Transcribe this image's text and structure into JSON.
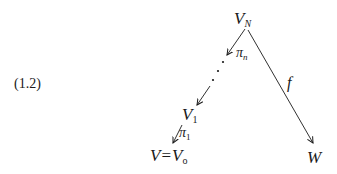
{
  "equation_number": "(1.2)",
  "diagram": {
    "nodes": {
      "top": {
        "base": "V",
        "sub": "N"
      },
      "middle": {
        "base": "V",
        "sub": "1"
      },
      "bottom_left": {
        "lhs": "V",
        "eq": "=",
        "base": "V",
        "sub": "o"
      },
      "bottom_right": {
        "base": "W"
      }
    },
    "arrows": {
      "pi_n": {
        "base": "π",
        "sub": "n"
      },
      "pi_1": {
        "base": "π",
        "sub": "1"
      },
      "f": {
        "label": "f"
      }
    },
    "ellipsis": "⋰"
  },
  "colors": {
    "ink": "#1a1a1a",
    "background": "#ffffff"
  }
}
